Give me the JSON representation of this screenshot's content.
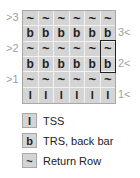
{
  "chart": {
    "rows": [
      {
        "cells": [
          "~",
          "~",
          "~",
          "~",
          "~",
          "~"
        ],
        "type": "tilde",
        "left_label": ">3",
        "right_label": ""
      },
      {
        "cells": [
          "b",
          "b",
          "b",
          "b",
          "b",
          "b"
        ],
        "type": "b",
        "left_label": "",
        "right_label": "3<"
      },
      {
        "cells": [
          "~",
          "~",
          "~",
          "~",
          "~",
          "~"
        ],
        "type": "tilde",
        "left_label": ">2",
        "right_label": ""
      },
      {
        "cells": [
          "b",
          "b",
          "b",
          "b",
          "b",
          "b"
        ],
        "type": "b",
        "left_label": "",
        "right_label": "2<"
      },
      {
        "cells": [
          "~",
          "~",
          "~",
          "~",
          "~",
          "~"
        ],
        "type": "tilde",
        "left_label": ">1",
        "right_label": ""
      },
      {
        "cells": [
          "I",
          "I",
          "I",
          "I",
          "I",
          "I"
        ],
        "type": "bar",
        "left_label": "",
        "right_label": "1<"
      }
    ],
    "highlight": {
      "column": 6,
      "rows": [
        3,
        4
      ]
    }
  },
  "legend": [
    {
      "symbol": "I",
      "label": "TSS"
    },
    {
      "symbol": "b",
      "label": "TRS, back bar"
    },
    {
      "symbol": "~",
      "label": "Return Row"
    }
  ]
}
